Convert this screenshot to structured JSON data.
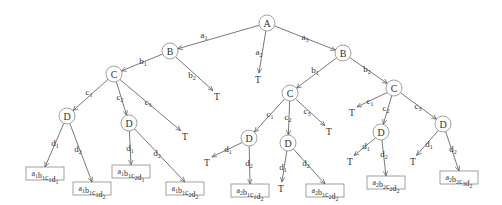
{
  "diagram": {
    "colors": {
      "edge": "#555555",
      "node_stroke": "#8a8a8a",
      "text": "#333333",
      "background": "#ffffff"
    },
    "nodes": [
      {
        "id": "A",
        "label": "A",
        "x": 267,
        "y": 23
      },
      {
        "id": "B1",
        "label": "B",
        "x": 170,
        "y": 51
      },
      {
        "id": "B2",
        "label": "B",
        "x": 343,
        "y": 53
      },
      {
        "id": "C11",
        "label": "C",
        "x": 114,
        "y": 74
      },
      {
        "id": "C21",
        "label": "C",
        "x": 290,
        "y": 93
      },
      {
        "id": "C22",
        "label": "C",
        "x": 394,
        "y": 88
      },
      {
        "id": "D111",
        "label": "D",
        "x": 67,
        "y": 116
      },
      {
        "id": "D112",
        "label": "D",
        "x": 129,
        "y": 123
      },
      {
        "id": "D211",
        "label": "D",
        "x": 249,
        "y": 138
      },
      {
        "id": "D212",
        "label": "D",
        "x": 288,
        "y": 143
      },
      {
        "id": "D222",
        "label": "D",
        "x": 381,
        "y": 132
      },
      {
        "id": "D223",
        "label": "D",
        "x": 443,
        "y": 124
      }
    ],
    "terminals": [
      {
        "id": "T_a2",
        "label": "T",
        "x": 258,
        "y": 83
      },
      {
        "id": "T_b2",
        "label": "T",
        "x": 217,
        "y": 100
      },
      {
        "id": "T_c13",
        "label": "T",
        "x": 185,
        "y": 140
      },
      {
        "id": "T_c23",
        "label": "T",
        "x": 329,
        "y": 135
      },
      {
        "id": "T_d2111",
        "label": "T",
        "x": 207,
        "y": 166
      },
      {
        "id": "T_d2121",
        "label": "T",
        "x": 281,
        "y": 192
      },
      {
        "id": "T_c21",
        "label": "T",
        "x": 352,
        "y": 116
      },
      {
        "id": "T_d2221",
        "label": "T",
        "x": 350,
        "y": 165
      },
      {
        "id": "T_d2231",
        "label": "T",
        "x": 413,
        "y": 165
      }
    ],
    "leaves": [
      {
        "id": "L1",
        "parts": [
          [
            "a",
            "1"
          ],
          [
            "b",
            "1"
          ],
          [
            "c",
            "1"
          ],
          [
            "d",
            "1"
          ]
        ],
        "x": 26,
        "y": 167,
        "w": 38,
        "h": 13
      },
      {
        "id": "L2",
        "parts": [
          [
            "a",
            "1"
          ],
          [
            "b",
            "1"
          ],
          [
            "c",
            "1"
          ],
          [
            "d",
            "2"
          ]
        ],
        "x": 73,
        "y": 182,
        "w": 38,
        "h": 13
      },
      {
        "id": "L3",
        "parts": [
          [
            "a",
            "1"
          ],
          [
            "b",
            "1"
          ],
          [
            "c",
            "2"
          ],
          [
            "d",
            "1"
          ]
        ],
        "x": 112,
        "y": 165,
        "w": 38,
        "h": 13
      },
      {
        "id": "L4",
        "parts": [
          [
            "a",
            "1"
          ],
          [
            "b",
            "1"
          ],
          [
            "c",
            "2"
          ],
          [
            "d",
            "2"
          ]
        ],
        "x": 166,
        "y": 182,
        "w": 38,
        "h": 13
      },
      {
        "id": "L5",
        "parts": [
          [
            "a",
            "2"
          ],
          [
            "b",
            "1"
          ],
          [
            "c",
            "1"
          ],
          [
            "d",
            "2"
          ]
        ],
        "x": 231,
        "y": 184,
        "w": 38,
        "h": 13
      },
      {
        "id": "L6",
        "parts": [
          [
            "a",
            "2"
          ],
          [
            "b",
            "1"
          ],
          [
            "c",
            "2"
          ],
          [
            "d",
            "2"
          ]
        ],
        "x": 306,
        "y": 184,
        "w": 38,
        "h": 13
      },
      {
        "id": "L7",
        "parts": [
          [
            "a",
            "2"
          ],
          [
            "b",
            "2"
          ],
          [
            "c",
            "2"
          ],
          [
            "d",
            "2"
          ]
        ],
        "x": 367,
        "y": 176,
        "w": 38,
        "h": 13
      },
      {
        "id": "L8",
        "parts": [
          [
            "a",
            "2"
          ],
          [
            "b",
            "2"
          ],
          [
            "c",
            "3"
          ],
          [
            "d",
            "2"
          ]
        ],
        "x": 440,
        "y": 171,
        "w": 38,
        "h": 13
      }
    ],
    "edges": [
      {
        "from": "A",
        "to": "B1",
        "label": [
          "a",
          "1"
        ],
        "lx": 204,
        "ly": 38
      },
      {
        "from": "A",
        "to": "T_a2",
        "label": [
          "a",
          "2"
        ],
        "lx": 259,
        "ly": 55
      },
      {
        "from": "A",
        "to": "B2",
        "label": [
          "a",
          "3"
        ],
        "lx": 305,
        "ly": 40
      },
      {
        "from": "B1",
        "to": "C11",
        "label": [
          "b",
          "1"
        ],
        "lx": 143,
        "ly": 64
      },
      {
        "from": "B1",
        "to": "T_b2",
        "label": [
          "b",
          "2"
        ],
        "lx": 192,
        "ly": 78
      },
      {
        "from": "B2",
        "to": "C21",
        "label": [
          "b",
          "1"
        ],
        "lx": 315,
        "ly": 73
      },
      {
        "from": "B2",
        "to": "C22",
        "label": [
          "b",
          "2"
        ],
        "lx": 367,
        "ly": 72
      },
      {
        "from": "C11",
        "to": "D111",
        "label": [
          "c",
          "1"
        ],
        "lx": 89,
        "ly": 95
      },
      {
        "from": "C11",
        "to": "D112",
        "label": [
          "c",
          "2"
        ],
        "lx": 120,
        "ly": 100
      },
      {
        "from": "C11",
        "to": "T_c13",
        "label": [
          "c",
          "3"
        ],
        "lx": 148,
        "ly": 105
      },
      {
        "from": "C21",
        "to": "D211",
        "label": [
          "c",
          "1"
        ],
        "lx": 270,
        "ly": 117
      },
      {
        "from": "C21",
        "to": "D212",
        "label": [
          "c",
          "2"
        ],
        "lx": 288,
        "ly": 120
      },
      {
        "from": "C21",
        "to": "T_c23",
        "label": [
          "c",
          "3"
        ],
        "lx": 307,
        "ly": 114
      },
      {
        "from": "C22",
        "to": "T_c21",
        "label": [
          "c",
          "1"
        ],
        "lx": 370,
        "ly": 104
      },
      {
        "from": "C22",
        "to": "D222",
        "label": [
          "c",
          "2"
        ],
        "lx": 386,
        "ly": 111
      },
      {
        "from": "C22",
        "to": "D223",
        "label": [
          "c",
          "3"
        ],
        "lx": 418,
        "ly": 109
      },
      {
        "from": "D111",
        "to": "L1",
        "label": [
          "d",
          "1"
        ],
        "lx": 55,
        "ly": 146
      },
      {
        "from": "D111",
        "to": "L2",
        "label": [
          "d",
          "2"
        ],
        "lx": 78,
        "ly": 152
      },
      {
        "from": "D112",
        "to": "L3",
        "label": [
          "d",
          "1"
        ],
        "lx": 130,
        "ly": 151
      },
      {
        "from": "D112",
        "to": "L4",
        "label": [
          "d",
          "2"
        ],
        "lx": 157,
        "ly": 156
      },
      {
        "from": "D211",
        "to": "T_d2111",
        "label": [
          "d",
          "1"
        ],
        "lx": 228,
        "ly": 152
      },
      {
        "from": "D211",
        "to": "L5",
        "label": [
          "d",
          "2"
        ],
        "lx": 249,
        "ly": 166
      },
      {
        "from": "D212",
        "to": "T_d2121",
        "label": [
          "d",
          "1"
        ],
        "lx": 283,
        "ly": 170
      },
      {
        "from": "D212",
        "to": "L6",
        "label": [
          "d",
          "2"
        ],
        "lx": 306,
        "ly": 166
      },
      {
        "from": "D222",
        "to": "T_d2221",
        "label": [
          "d",
          "1"
        ],
        "lx": 366,
        "ly": 149
      },
      {
        "from": "D222",
        "to": "L7",
        "label": [
          "d",
          "2"
        ],
        "lx": 384,
        "ly": 157
      },
      {
        "from": "D223",
        "to": "T_d2231",
        "label": [
          "d",
          "1"
        ],
        "lx": 429,
        "ly": 147
      },
      {
        "from": "D223",
        "to": "L8",
        "label": [
          "d",
          "2"
        ],
        "lx": 453,
        "ly": 152
      }
    ]
  }
}
